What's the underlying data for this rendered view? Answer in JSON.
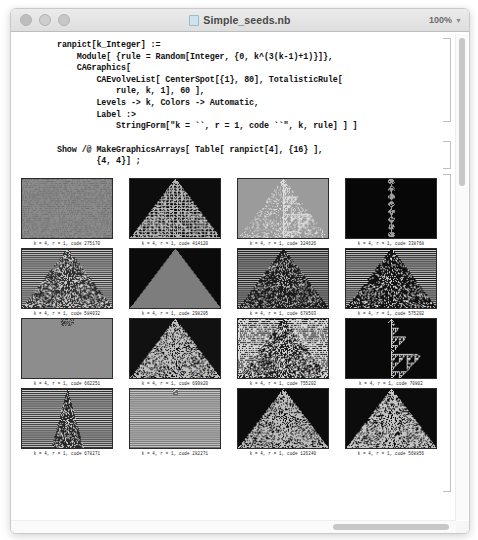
{
  "window": {
    "title": "Simple_seeds.nb",
    "zoom_level": "100%",
    "traffic_lights": [
      "close-button",
      "minimize-button",
      "maximize-button"
    ]
  },
  "code": {
    "cell1": "ranpict[k_Integer] :=\n    Module[ {rule = Random[Integer, {0, k^(3(k-1)+1)}]},\n    CAGraphics[\n        CAEvolveList[ CenterSpot[{1}, 80], TotalisticRule[\n            rule, k, 1], 60 ],\n        Levels -> k, Colors -> Automatic,\n        Label :>\n            StringForm[\"k = ``, r = 1, code ``\", k, rule] ] ]",
    "cell2": "Show /@ MakeGraphicsArrays[ Table[ ranpict[4], {16} ],\n        {4, 4}] ;"
  },
  "grid": {
    "rows": 4,
    "cols": 4,
    "cells": [
      {
        "caption": "k = 4, r = 1, code 275170",
        "pattern": "dense-stripes",
        "bg": "#8a8a8a",
        "fg": "#6f6f6f",
        "density": 0.55,
        "seed": 11
      },
      {
        "caption": "k = 4, r = 1, code 414120",
        "pattern": "maze-triangle",
        "bg": "#0d0d0d",
        "fg": "#b5b5b5",
        "density": 0.5,
        "seed": 22
      },
      {
        "caption": "k = 4, r = 1, code 324626",
        "pattern": "nested-triangle",
        "bg": "#9b9b9b",
        "fg": "#dcdcdc",
        "density": 0.45,
        "seed": 33
      },
      {
        "caption": "k = 4, r = 1, code 338768",
        "pattern": "thin-column",
        "bg": "#070707",
        "fg": "#9e9e9e",
        "density": 0.35,
        "seed": 44
      },
      {
        "caption": "k = 4, r = 1, code 584032",
        "pattern": "noisy-triangle",
        "bg": "#c9c9c9",
        "fg": "#2e2e2e",
        "density": 0.52,
        "seed": 55
      },
      {
        "caption": "k = 4, r = 1, code 298205",
        "pattern": "solid-triangle",
        "bg": "#0b0b0b",
        "fg": "#7d7d7d",
        "density": 0.2,
        "seed": 66
      },
      {
        "caption": "k = 4, r = 1, code 678503",
        "pattern": "chaotic-cone",
        "bg": "#b7b7b7",
        "fg": "#1c1c1c",
        "density": 0.6,
        "seed": 77
      },
      {
        "caption": "k = 4, r = 1, code 575202",
        "pattern": "dark-triangle",
        "bg": "#d2d2d2",
        "fg": "#121212",
        "density": 0.58,
        "seed": 88
      },
      {
        "caption": "k = 4, r = 1, code 662251",
        "pattern": "tiny-seed",
        "bg": "#8d8d8d",
        "fg": "#3a3a3a",
        "density": 0.05,
        "seed": 99
      },
      {
        "caption": "k = 4, r = 1, code 699820",
        "pattern": "speckle-cone",
        "bg": "#111111",
        "fg": "#c0c0c0",
        "density": 0.55,
        "seed": 101
      },
      {
        "caption": "k = 4, r = 1, code 755202",
        "pattern": "banded-cone",
        "bg": "#d6d6d6",
        "fg": "#1a1a1a",
        "density": 0.5,
        "seed": 111
      },
      {
        "caption": "k = 4, r = 1, code 70802",
        "pattern": "sierpinski",
        "bg": "#090909",
        "fg": "#cfcfcf",
        "density": 0.4,
        "seed": 121
      },
      {
        "caption": "k = 4, r = 1, code 678271",
        "pattern": "narrow-spire",
        "bg": "#cfcfcf",
        "fg": "#272727",
        "density": 0.3,
        "seed": 131
      },
      {
        "caption": "k = 4, r = 1, code 282271",
        "pattern": "flat-stripes",
        "bg": "#cbcbcb",
        "fg": "#6a6a6a",
        "density": 0.08,
        "seed": 141
      },
      {
        "caption": "k = 4, r = 1, code 126240",
        "pattern": "speckle-cone",
        "bg": "#0c0c0c",
        "fg": "#bdbdbd",
        "density": 0.55,
        "seed": 151
      },
      {
        "caption": "k = 4, r = 1, code 568856",
        "pattern": "speckle-cone",
        "bg": "#0c0c0c",
        "fg": "#c4c4c4",
        "density": 0.55,
        "seed": 161
      }
    ]
  },
  "scrollbars": {
    "vertical": "vertical-scrollbar",
    "horizontal": "horizontal-scrollbar"
  }
}
